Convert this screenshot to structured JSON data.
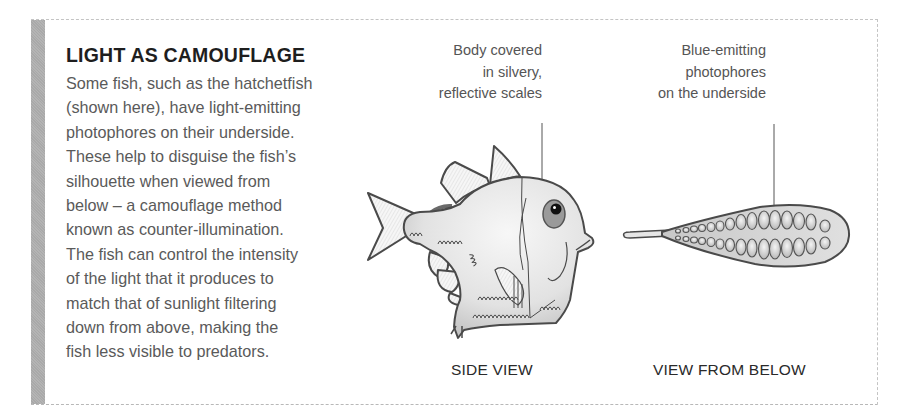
{
  "sidebar_box": {
    "title": "LIGHT AS CAMOUFLAGE",
    "body_lines": [
      "Some fish, such as the hatchetfish",
      "(shown here), have light-emitting",
      "photophores on their underside.",
      "These help to disguise the fish’s",
      "silhouette when viewed from",
      "below – a camouflage method",
      "known as counter-illumination.",
      "The fish can control the intensity",
      "of the light that it produces to",
      "match that of sunlight filtering",
      "down from above, making the",
      "fish less visible to predators."
    ],
    "accent_bar_color": "#aeaeae"
  },
  "side_view": {
    "label": "SIDE VIEW",
    "callout_lines": [
      "Body covered",
      "in silvery,",
      "reflective scales"
    ]
  },
  "below_view": {
    "label": "VIEW FROM BELOW",
    "callout_lines": [
      "Blue-emitting",
      "photophores",
      "on the underside"
    ]
  },
  "colors": {
    "outline": "#4a4a4a",
    "body_fill": "#e6e6e6",
    "eye_ring": "#8e8e8e",
    "photophore_fill": "#d4d4d4"
  }
}
